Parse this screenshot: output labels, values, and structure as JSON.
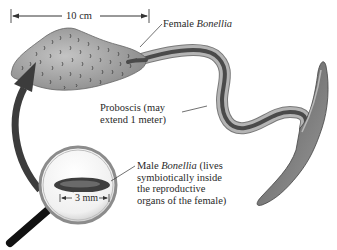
{
  "diagram": {
    "scale_female": "10 cm",
    "scale_male": "3 mm",
    "labels": {
      "female": {
        "prefix": "Female ",
        "italic": "Bonellia"
      },
      "proboscis": {
        "line1": "Proboscis (may",
        "line2": "extend 1 meter)"
      },
      "male": {
        "line1_prefix": "Male ",
        "line1_italic": "Bonellia",
        "line1_suffix": " (lives",
        "line2": "symbiotically inside",
        "line3": "the reproductive",
        "line4": "organs of the female)"
      }
    },
    "colors": {
      "body_gray": "#9a9a9a",
      "proboscis_outer": "#a8a8a8",
      "proboscis_inner": "#4a4a4a",
      "arrow": "#3c3c3c",
      "lens_rim": "#8c8c8c",
      "handle": "#111111"
    }
  }
}
